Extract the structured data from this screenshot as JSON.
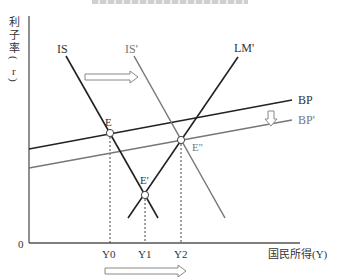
{
  "diagram": {
    "title_fragment": "【...】",
    "y_axis_label": [
      "利",
      "子",
      "率",
      "(",
      "r",
      ")"
    ],
    "x_axis_label": "国民所得(Y)",
    "origin_label": "0",
    "curves": [
      {
        "name": "IS",
        "label": "IS",
        "color": "#222222",
        "from": [
          66,
          56
        ],
        "to": [
          158,
          218
        ]
      },
      {
        "name": "IS'",
        "label": "IS'",
        "color": "#777777",
        "from": [
          134,
          56
        ],
        "to": [
          225,
          218
        ]
      },
      {
        "name": "LM'",
        "label": "LM'",
        "color": "#222222",
        "from": [
          238,
          57
        ],
        "to": [
          128,
          218
        ]
      },
      {
        "name": "BP",
        "label": "BP",
        "color": "#222222",
        "from": [
          29,
          149
        ],
        "to": [
          292,
          100
        ]
      },
      {
        "name": "BP'",
        "label": "BP'",
        "color": "#777777",
        "from": [
          29,
          168
        ],
        "to": [
          292,
          120
        ]
      }
    ],
    "points": [
      {
        "name": "E",
        "label": "E",
        "xy": [
          110,
          133
        ],
        "x_tick": "Y0"
      },
      {
        "name": "E'",
        "label": "E'",
        "xy": [
          145,
          195
        ],
        "x_tick": "Y1"
      },
      {
        "name": "E''",
        "label": "E''",
        "xy": [
          181,
          140
        ],
        "x_tick": "Y2"
      }
    ],
    "x_ticks": [
      "Y0",
      "Y1",
      "Y2"
    ],
    "arrows": [
      {
        "name": "is-shift-arrow",
        "direction": "right"
      },
      {
        "name": "bp-shift-arrow",
        "direction": "down"
      },
      {
        "name": "income-shift-arrow",
        "direction": "right"
      }
    ]
  }
}
